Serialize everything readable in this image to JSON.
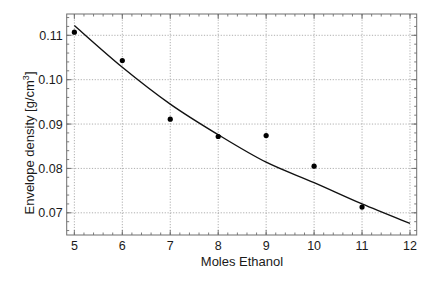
{
  "chart_data": {
    "type": "scatter",
    "title": "",
    "xlabel": "Moles Ethanol",
    "ylabel": "Envelope density [g/cm³]",
    "ylabel_parts": {
      "main": "Envelope density [g/cm",
      "sup": "3",
      "end": "]"
    },
    "xlim": [
      4.84,
      12.14
    ],
    "ylim": [
      0.065,
      0.1148
    ],
    "xticks": [
      5,
      6,
      7,
      8,
      9,
      10,
      11,
      12
    ],
    "xtick_labels": [
      "5",
      "6",
      "7",
      "8",
      "9",
      "10",
      "11",
      "12"
    ],
    "yticks": [
      0.07,
      0.08,
      0.09,
      0.1,
      0.11
    ],
    "ytick_labels": [
      "0.07",
      "0.08",
      "0.09",
      "0.10",
      "0.11"
    ],
    "x_minor_step": 0.2,
    "y_minor_step": 0.002,
    "grid": true,
    "legend": null,
    "series": [
      {
        "name": "Measured",
        "kind": "scatter",
        "x": [
          5,
          6,
          7,
          8,
          9,
          10,
          11
        ],
        "y": [
          0.1107,
          0.1043,
          0.0911,
          0.0872,
          0.0874,
          0.0805,
          0.0713
        ],
        "color": "#000000"
      },
      {
        "name": "Fit",
        "kind": "line",
        "x": [
          5,
          6,
          7,
          8,
          9,
          10,
          11,
          12
        ],
        "y": [
          0.1122,
          0.1028,
          0.0945,
          0.0876,
          0.0814,
          0.0768,
          0.072,
          0.0676
        ],
        "color": "#111111"
      }
    ]
  }
}
